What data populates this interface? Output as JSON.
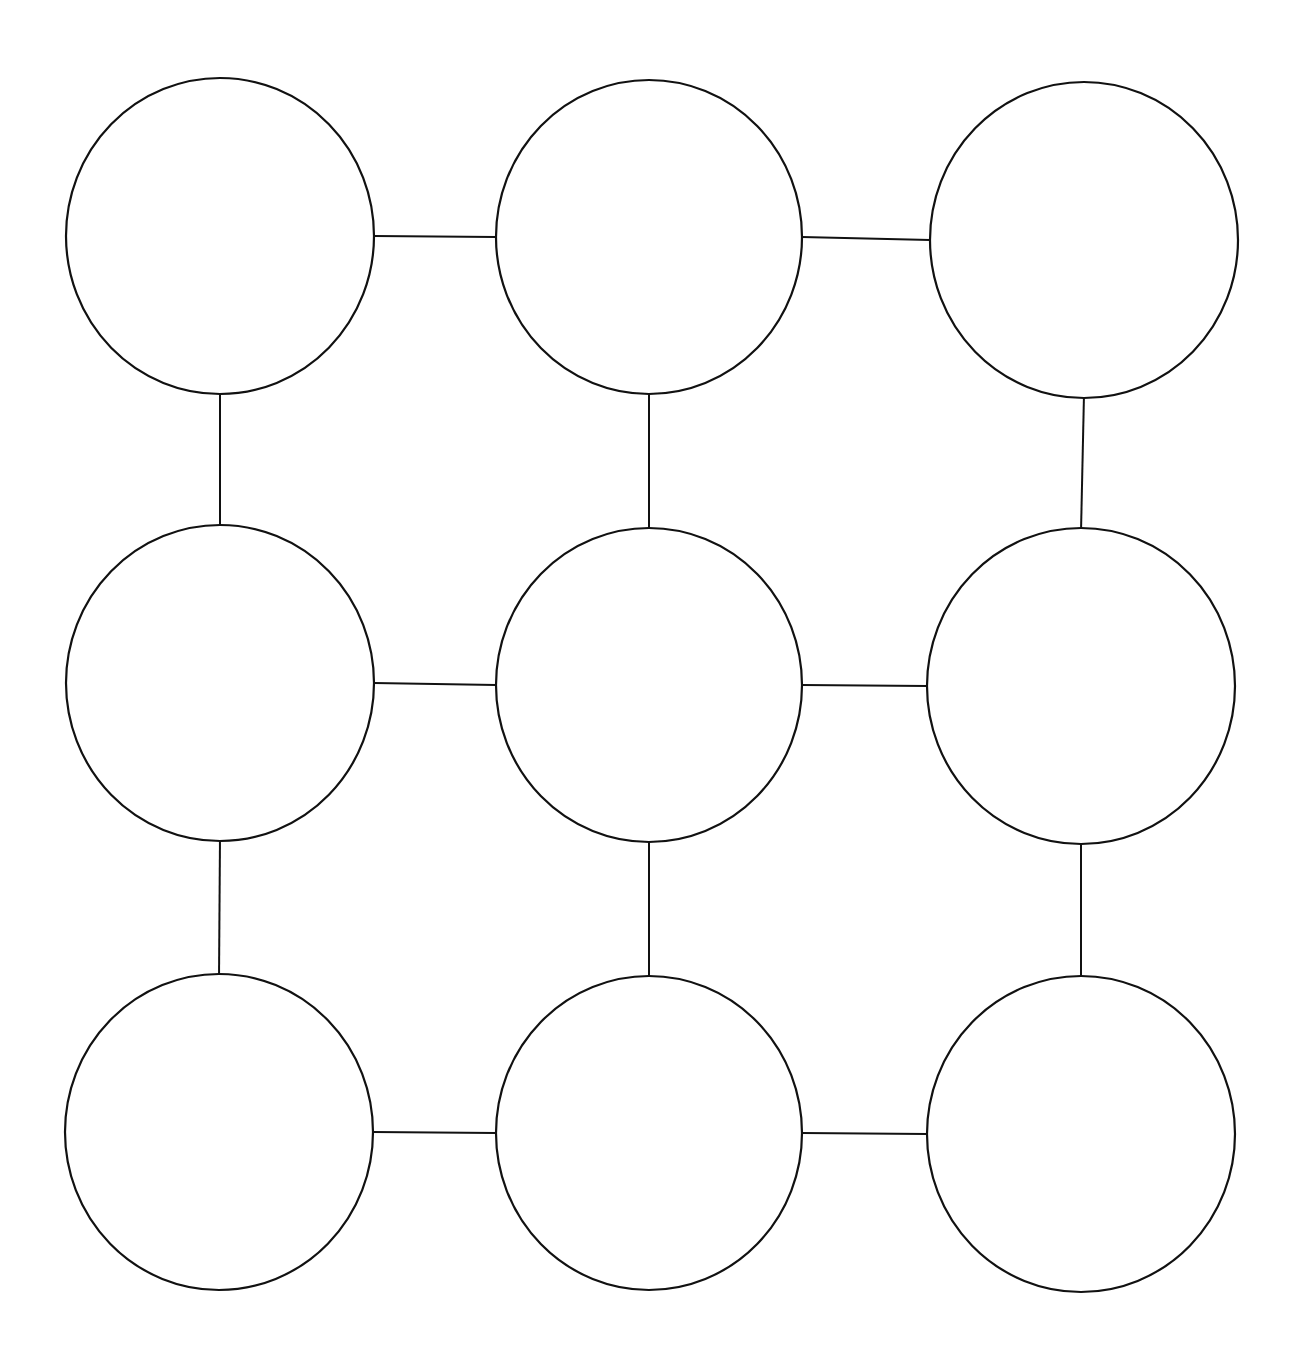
{
  "diagram": {
    "type": "grid-graph",
    "rows": 3,
    "cols": 3,
    "background": "#ffffff",
    "stroke_color": "#111111",
    "nodes": [
      {
        "id": "r1c1",
        "row": 1,
        "col": 1,
        "cx": 220,
        "cy": 236,
        "r": 154,
        "label": ""
      },
      {
        "id": "r1c2",
        "row": 1,
        "col": 2,
        "cx": 649,
        "cy": 237,
        "r": 153,
        "label": ""
      },
      {
        "id": "r1c3",
        "row": 1,
        "col": 3,
        "cx": 1084,
        "cy": 240,
        "r": 154,
        "label": ""
      },
      {
        "id": "r2c1",
        "row": 2,
        "col": 1,
        "cx": 220,
        "cy": 683,
        "r": 154,
        "label": ""
      },
      {
        "id": "r2c2",
        "row": 2,
        "col": 2,
        "cx": 649,
        "cy": 685,
        "r": 153,
        "label": ""
      },
      {
        "id": "r2c3",
        "row": 2,
        "col": 3,
        "cx": 1081,
        "cy": 686,
        "r": 154,
        "label": ""
      },
      {
        "id": "r3c1",
        "row": 3,
        "col": 1,
        "cx": 219,
        "cy": 1132,
        "r": 154,
        "label": ""
      },
      {
        "id": "r3c2",
        "row": 3,
        "col": 2,
        "cx": 649,
        "cy": 1133,
        "r": 153,
        "label": ""
      },
      {
        "id": "r3c3",
        "row": 3,
        "col": 3,
        "cx": 1081,
        "cy": 1134,
        "r": 154,
        "label": ""
      }
    ],
    "edges": [
      {
        "from": "r1c1",
        "to": "r1c2",
        "orientation": "horizontal"
      },
      {
        "from": "r1c2",
        "to": "r1c3",
        "orientation": "horizontal"
      },
      {
        "from": "r2c1",
        "to": "r2c2",
        "orientation": "horizontal"
      },
      {
        "from": "r2c2",
        "to": "r2c3",
        "orientation": "horizontal"
      },
      {
        "from": "r3c1",
        "to": "r3c2",
        "orientation": "horizontal"
      },
      {
        "from": "r3c2",
        "to": "r3c3",
        "orientation": "horizontal"
      },
      {
        "from": "r1c1",
        "to": "r2c1",
        "orientation": "vertical"
      },
      {
        "from": "r2c1",
        "to": "r3c1",
        "orientation": "vertical"
      },
      {
        "from": "r1c2",
        "to": "r2c2",
        "orientation": "vertical"
      },
      {
        "from": "r2c2",
        "to": "r3c2",
        "orientation": "vertical"
      },
      {
        "from": "r1c3",
        "to": "r2c3",
        "orientation": "vertical"
      },
      {
        "from": "r2c3",
        "to": "r3c3",
        "orientation": "vertical"
      }
    ]
  }
}
